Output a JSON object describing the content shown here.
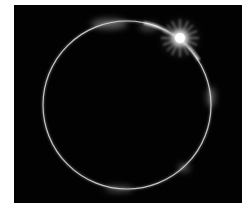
{
  "image": {
    "subject": "Total solar eclipse diamond ring",
    "alt": "Solar eclipse diamond ring effect with bright flare at upper right of a thin glowing ring",
    "colors": {
      "background": "#020202",
      "frame": "#ffffff",
      "ring": "#e8e8e8",
      "flare": "#ffffff"
    },
    "ring": {
      "cx": 113,
      "cy": 100,
      "r": 84
    },
    "flare": {
      "cx": 166,
      "cy": 33
    }
  }
}
